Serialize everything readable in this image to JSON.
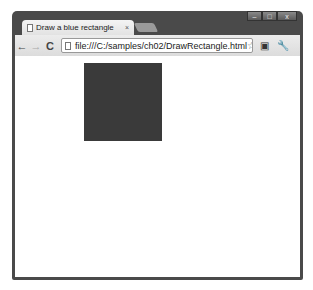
{
  "window": {
    "tab_title": "Draw a blue rectangle",
    "tab_close": "×",
    "controls": {
      "minimize": "–",
      "maximize": "□",
      "close": "x"
    }
  },
  "toolbar": {
    "back": "←",
    "forward": "→",
    "reload": "C",
    "url": "file:///C:/samples/ch02/DrawRectangle.html",
    "star": "☆",
    "page_icon": "▣",
    "wrench_icon": "🔧"
  },
  "canvas": {
    "rectangle_color": "#3a3a3a"
  }
}
